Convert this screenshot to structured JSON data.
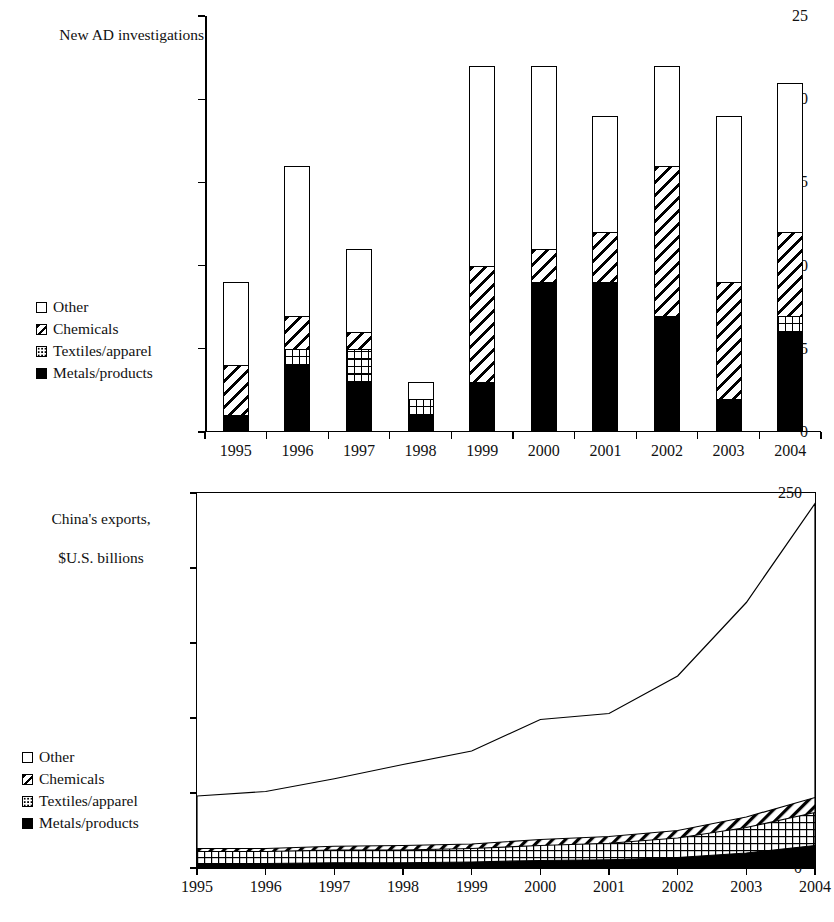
{
  "figure": {
    "panels": [
      {
        "id": "bar",
        "axis_title": "New AD investigations 25\nagainst Chinese exports",
        "axis_title_text": "New AD investigations",
        "axis_title_line2": "against Chinese exports"
      },
      {
        "id": "area",
        "axis_title_line1": "China's exports,",
        "axis_title_line2": "$U.S. billions"
      }
    ]
  },
  "legend": {
    "items": [
      {
        "label": "Other",
        "key": "other",
        "pattern": "white"
      },
      {
        "label": "Chemicals",
        "key": "chem",
        "pattern": "diagonal-hatch"
      },
      {
        "label": "Textiles/apparel",
        "key": "tex",
        "pattern": "dotted"
      },
      {
        "label": "Metals/products",
        "key": "metal",
        "pattern": "solid-black"
      }
    ]
  },
  "chart_data": [
    {
      "type": "bar",
      "id": "ad-investigations",
      "title": "New AD investigations against Chinese exports",
      "subtitle": "",
      "stacked": true,
      "xlabel": "",
      "ylabel": "New AD investigations against Chinese exports",
      "ylim": [
        0,
        25
      ],
      "yticks": [
        0,
        5,
        10,
        15,
        20,
        25
      ],
      "ytick_labels": [
        "0",
        "5",
        "10",
        "15",
        "20",
        "25"
      ],
      "grid": false,
      "legend_position": "left-middle",
      "categories": [
        "1995",
        "1996",
        "1997",
        "1998",
        "1999",
        "2000",
        "2001",
        "2002",
        "2003",
        "2004"
      ],
      "series": [
        {
          "name": "Metals/products",
          "pattern": "solid-black",
          "values": [
            1,
            4,
            3,
            1,
            3,
            9,
            9,
            7,
            2,
            6
          ]
        },
        {
          "name": "Textiles/apparel",
          "pattern": "dotted",
          "values": [
            0,
            1,
            2,
            1,
            0,
            0,
            0,
            0,
            0,
            1
          ]
        },
        {
          "name": "Chemicals",
          "pattern": "diagonal-hatch",
          "values": [
            3,
            2,
            1,
            0,
            7,
            2,
            3,
            9,
            7,
            5
          ]
        },
        {
          "name": "Other",
          "pattern": "white",
          "values": [
            5,
            9,
            5,
            1,
            12,
            11,
            7,
            6,
            10,
            9
          ]
        }
      ],
      "totals": [
        9,
        16,
        11,
        3,
        22,
        22,
        19,
        22,
        19,
        21
      ]
    },
    {
      "type": "area",
      "id": "china-exports",
      "title": "China's exports, $U.S. billions",
      "stacked": true,
      "xlabel": "",
      "ylabel": "China's exports, $U.S. billions",
      "ylim": [
        0,
        250
      ],
      "yticks": [
        0,
        50,
        100,
        150,
        200,
        250
      ],
      "ytick_labels": [
        "0",
        "50",
        "100",
        "150",
        "200",
        "250"
      ],
      "grid": false,
      "legend_position": "left-lower",
      "x": [
        "1995",
        "1996",
        "1997",
        "1998",
        "1999",
        "2000",
        "2001",
        "2002",
        "2003",
        "2004"
      ],
      "series": [
        {
          "name": "Metals/products",
          "pattern": "solid-black",
          "values": [
            3,
            3,
            3.5,
            3.5,
            4,
            5,
            5.5,
            7,
            10,
            15
          ]
        },
        {
          "name": "Textiles/apparel",
          "pattern": "dotted",
          "values": [
            8,
            8,
            8.5,
            8.5,
            9,
            10,
            11,
            13,
            17,
            22
          ]
        },
        {
          "name": "Chemicals",
          "pattern": "diagonal-hatch",
          "values": [
            2,
            2,
            2.5,
            3,
            3,
            4,
            4.5,
            5,
            7,
            10
          ]
        },
        {
          "name": "Other",
          "pattern": "white",
          "values": [
            35,
            38,
            45,
            54,
            62,
            80,
            82,
            103,
            143,
            196
          ]
        }
      ],
      "cumulative_tops": {
        "metals": [
          3,
          3,
          3.5,
          3.5,
          4,
          5,
          5.5,
          7,
          10,
          15
        ],
        "textiles": [
          11,
          11,
          12,
          12,
          13,
          15,
          16.5,
          20,
          27,
          37
        ],
        "chemicals": [
          13,
          13,
          14.5,
          15,
          16,
          19,
          21,
          25,
          34,
          47
        ],
        "total": [
          48,
          51,
          59.5,
          69,
          78,
          99,
          103,
          128,
          177,
          243
        ]
      }
    }
  ]
}
